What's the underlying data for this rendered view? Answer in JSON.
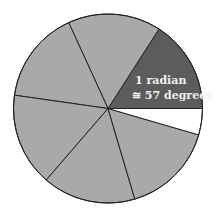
{
  "diagram": {
    "type": "radian-circle",
    "label_line1": "1 radian",
    "label_line2": "≅ 57 degrees",
    "sector_count_full": 6,
    "radian_degrees": 57.2958,
    "colors": {
      "highlight_sector": "#5c5c5c",
      "other_sectors": "#a9a9a9",
      "remainder_sector": "#ffffff",
      "lines": "#222222",
      "label_text": "#f0f0f0"
    }
  }
}
